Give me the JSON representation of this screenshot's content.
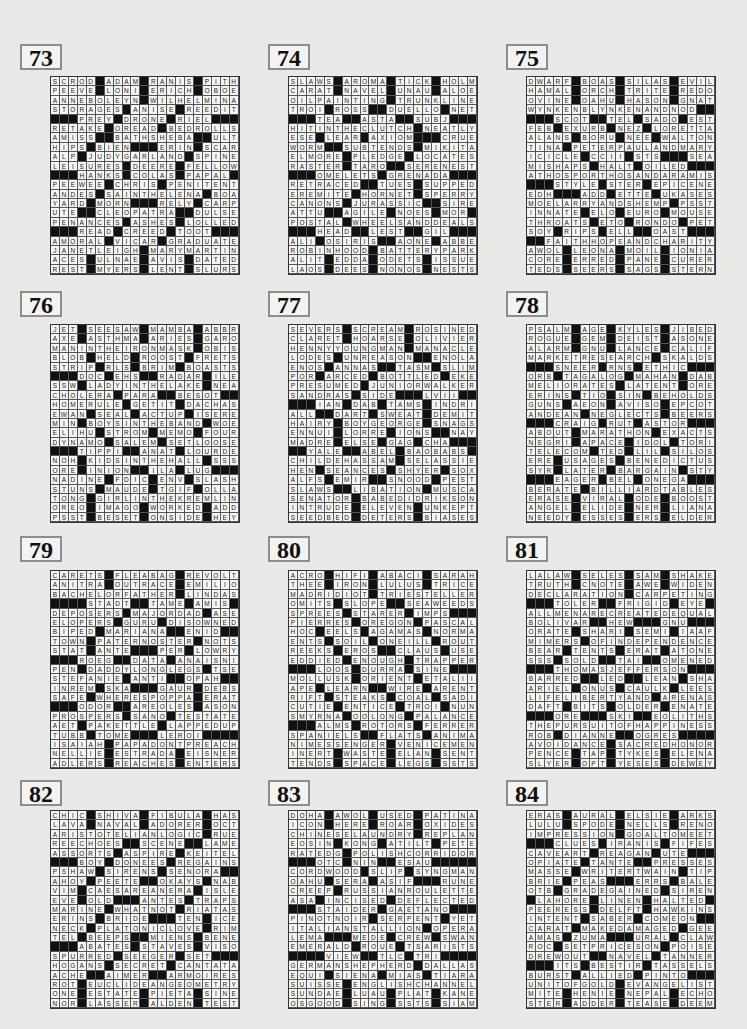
{
  "puzzles": [
    {
      "number": "73",
      "grid": [
        "SCROD#ADAM#RANIS#PITH",
        "PEEVE#LONI#ERICH#OBOE",
        "ANNEBOLEYN#WILHELMINA",
        "STORAGES#ANISE#REEDIT",
        "###PREY#DRONE#RIEL###",
        "RETAKE#OREAD#BEDROLLS",
        "AMISS##BATHSHEBA##ULT",
        "HIPS#BIEN###ERIN#SCAR",
        "ALP#JUDYGARLAND#SPINE",
        "LEISURES#DEERE#FELLOW",
        "###HANKS#COLAS#PAPAL#",
        "PEEWEE#CHRIS#PENITENT",
        "ANDES#SAINTHELENA#BOA",
        "YARD#MORN###RELY#CARP",
        "UTE##CLEOPATRA##DULSE",
        "PENANCES#ASHES#LOLLED",
        "###READ#CREED#TOOT###",
        "AMORAL#VICAR#GRADUATE",
        "JANETLEIGH#MARYMARTIN",
        "ACES#ULNAE#AVIS#DATED",
        "REST#MYERS#LENT#SLURS"
      ]
    },
    {
      "number": "74",
      "grid": [
        "SLAWS#AROMA#TICK#HOLM",
        "CARAT#NAVEL#UNAU#ALOE",
        "OILPAINTING#TRUNKLINE",
        "TROI#ROSS##DUELLO#NET",
        "###TEA##ASTA##SUBJ###",
        "HITINTHECLUTCH#NEATLY",
        "ESE#LEAR#AXIOM###CRUE",
        "WORM##SUBTENDS#MIKITA",
        "ELMORE#PLEDGE#LOCATES",
        "RASTER#TARO##SERENEST",
        "###OMELETS#GRENADA###",
        "RETRACED##TUES#SUPPED",
        "EREMITE#HORNET#SPERRY",
        "CANONS#JURASSIC##SIRE",
        "ATTU##AGILE#NOES#MOR",
        "POSTAL#WHEELSANDDEALS",
        "###HEAD##LEST##GIL###",
        "ALI#OSIRIS##AONE#ABBE",
        "ROBINHOOD#BATTERYPARK",
        "ALIT#EDDA#ODETS#ISSUE",
        "LAOS#DEES#NONOS#NESTS"
      ]
    },
    {
      "number": "75",
      "grid": [
        "DWARF#BOAS#SILAS#EVIL",
        "HAMAL#ORCH#TRITE#REDO",
        "OVINE#OAHU#HASON#GNAT",
        "WYNKENBLYNKENANDNOD##",
        "###SCOT##TEL#SADO#EST",
        "FEB#EXURB#NEZ#LORETTA",
        "ALANS#BORU#NEE#WALTON",
        "TINA#PETERPAULANDMARY",
        "ICICLE#CCII#STS###SEA",
        "MISHAPS#HALT#OILED###",
        "ATHOSPORTHOSANDARAMIS",
        "###STYLE#STER#EPICENE",
        "EDH###ADD#ETTE#UKASES",
        "MOELARRYANDSHEMP#PSST",
        "INNATE#ELO#EURO#MOUSE",
        "THROATS#ETO#RONDO#PET",
        "SOY#RIPS#ELL##OAST###",
        "##FAITHHOPEANDCHARITY",
        "AWOL#LEONA#MOIL#IONIA",
        "CORE#ERRED#PANE#CURER",
        "TEDS#SEERS#SAGS#STERN"
      ]
    },
    {
      "number": "76",
      "grid": [
        "JET#SEESAW#MAMBA#ABBR",
        "AXE#ASTHMA#ARIES#GARO",
        "MANINTHEIRONMASK#OBIS",
        "BLOB#HELD#ROOST#FRETS",
        "STRIP#RLS#BRIM#BOASTS",
        "###DOC#EHS##RADAR#ILE",
        "SSW#LADYINTHELAKE#NEA",
        "CHOLERA#PARA##BESOT##",
        "HOMERULE#GETIT#DACHAS",
        "EWAN#SEAL#ACTUP#ISERE",
        "MIN#BOYSINTHEBAND#WOE",
        "ELIHU#STROM#MEMO#FOUR",
        "DYNAMO#SALEM#SETLOOSE",
        "###TIPPI##ANAT#LOURDES",
        "NOH#KIDSINTHEHALL#SSS",
        "ORE#INION##ILA#LUG###",
        "NADINE#FDIC#ENV#SLASH",
        "STUNS#MAUDE#TGIF#OLLA",
        "TONG#GIRLINTHEKREMLIN",
        "OREO#IMAGO#WORKED#ADD",
        "PSST#BESET#ONSIDE#HEY"
      ]
    },
    {
      "number": "77",
      "grid": [
        "SEVERS#SCREAM#ROSINED",
        "CLARET#HOARSE#OLIVIER",
        "HENNYYOUNGMAN#MANACLE",
        "LODES#UNREASON##ENOLA",
        "ENOS#ANNAS##TASM#SLIM",
        "POR#ARCED#BOTTLED#EKE",
        "PRESUMED#JUNIORWALKER",
        "SANDRAS#SIDE###LVII##",
        "###IAN#DAB#TAMS#INDRI",
        "ALL##DART#SWEAT#DEMIT",
        "HAIRY#BOYGEORGE#SNAGS",
        "ENNUI#LORRE#IONS##NAY",
        "MADRE#ELSE#GAG#CHA###",
        "##YALE##ABEL#BAOBABS",
        "CHILDEHASSAM#SELASSIE",
        "HEN#SEANCES#SHYER#SOX",
        "ALFS#EMIR##SNOOD#PEST",
        "SLAWS##LIBATION#MUSCA",
        "SENATOR#BABEDIDRIKSON",
        "INTRUDE#ELEVEN#UNKEPT",
        "SEEDBED#DETERS#BIASES"
      ]
    },
    {
      "number": "78",
      "grid": [
        "PSALM#AGE#KYLES#JIBED",
        "ROGUE#GEM#DEIST#ASONE",
        "ALARM#GNU#LANCE#CALIF",
        "MARKETRESEARCH#SKALDS",
        "###SNEER#RNS#ETHIC###",
        "ORB#TAGALOG#MAHAN#DAB",
        "MELIORATES#LATENT#ORE",
        "ERINS#TIO#SIN#BEHOLDS",
        "GUNS#AEON#AVISO#EPCOT",
        "ANDEAN#NEGLECTS#BEERS",
        "###CRAIG#RUT#ASTOR###",
        "ABOUT#MARATHON#EXACTS",
        "NEGRI#APACE#IDOL#TORI",
        "TELECOM#TED#LIL#SILOS",
        "ERE#USAGES#BENEDICTUS",
        "SYR#LATER#BARGAIN#STY",
        "###EAGER#BEL#ONEGA###",
        "BERATE#BILLIARDTABLES",
        "ERASE#VIRAL#ODE#BOOST",
        "ANGEL#ELIDE#NER#LIANA",
        "NEEDY#ESSES#ERS#ELDER"
      ]
    },
    {
      "number": "79",
      "grid": [
        "CARETS#FLEABAG#REVOLT",
        "ANITRA#OUTRACE#EMILIO",
        "BACHELORFATHER#LINDAS",
        "####STADT##TAME#AMIS",
        "DEPOSERS#MAJORDAD#ASE",
        "ELOPERS#GURU#DISOWNED",
        "BIPED#MARIANA##ENID##",
        "TOWN#PATERNOSTER#NOTS",
        "STAT#ANTE###PER#LOWRY",
        "###ROEG##DATA#ANAISNIN",
        "PEN#DADDYLONGLEGS#TSE",
        "STEFANIE#ANTI##OPAH##",
        "INREM#SKA###GAUR#DEBS",
        "SAFE#WHERESPOPPA#ERAT",
        "###ODOR##AREOLES#ASONE",
        "PROSPERS#SANO#TESTATE",
        "AET#PAKETTLE#LAPPEDUP",
        "TUBB#TOME###LEROI####",
        "ISAIAH#PAPADONTPREACH",
        "NELLIE#ESTRADA#EISNER",
        "ADLERS#REACHES#ENTERS"
      ]
    },
    {
      "number": "80",
      "grid": [
        "ACRO#HIFI#ABACI#SARAH",
        "THEE#IRON#LULUS#TRICE",
        "MADRIDIOT#TRIESTELLER",
        "OMITS#SLOPE##SEAWEEDS",
        "SPREES#STARER#IMPS###",
        "PIERRES#OREGON#PASCAL",
        "HOC#EELS#AGAMAS#NORMA",
        "ENTS#SOIL#ONEILL#ROUT",
        "REEKS#EROS##CLAUS#USE",
        "EDDIED#ENOUGH#TRAPPER",
        "###LOOS#DURRA#SINE###",
        "MOLLUSK#ORIENT#ETALII",
        "APE#LEARN##WIRE#ARENT",
        "RIFT#STEAKS#COAL#SADI",
        "CUTIE#ENTICE#TROI#NUN",
        "SMYRNA#OOLONG#PALANCE",
        "###ALMS#ROTORS#FERRER",
        "SPANIELS##FLATS#ANIMA",
        "NIMESSENGER#VENICEMEN",
        "INERT#WASTE#ELAN#SENT",
        "TENDS#SPACE#LEGS#SSTS"
      ]
    },
    {
      "number": "81",
      "grid": [
        "LALAW#SELES#SAM#SHAKE",
        "TRUTH#CNOTE#AWE#WIDEN",
        "DECLARATION#CARPETING",
        "###TOLER##FRIGID#EYE",
        "ALLMENARECREATEDEQUAL",
        "BOLIVAR##HEW###GNU###",
        "ORATE#SHARI#SEMI#IAAF",
        "MIMERS#OFINDEPENDENCE",
        "BEAR#TENTS#ERAT#ATONE",
        "SSS#SOLD##TAI##OMENED",
        "###THOMASJEFFERSON###",
        "BARRED##LED##LEAN#SHA",
        "ARIEL#ONUS#CAULK#LEES",
        "LIFELIBERTYAND#ARENAS",
        "DAFT#BITS#OLDER#ENATE",
        "###ORE###SKI##EOLITHS",
        "THEPURSUITOFHAPPINESS",
        "ROB#DIANNE##OGRES####",
        "AVOIDANCE#SACREDHONOR",
        "PENCE#TAP#TYKES#ELENA",
        "SLYER#OPT#YESES#DEWEY"
      ]
    },
    {
      "number": "82",
      "grid": [
        "CHIC#SHIVA#FIBULA#HAS",
        "LAVA#NAVAL#ADORER#OCT",
        "ARISTOTELIANLOGIC#RUE",
        "REECHOES##SCENE##LAME",
        "ASSORTS#ASPIRE#KEITEL",
        "###BOY#DONEES#REGAINS",
        "PSHAW#SIRENS#SENORA##",
        "AHOY#PEETE##OKAYS#NAB",
        "VIM#CAESAREANERA#ISLE",
        "EVE#OLD###ANTES#TRAPS",
        "MARINE#WHATNOT#RIATAS",
        "ERINS#BRIDE###TEN#ICE",
        "NECK#PLATONICLOVE#RIM",
        "TEL#BEEPS##MIENS#BENE",
        "###ABATES#STAVES#VISOR",
        "SPURRED#SEEGER#SET###",
        "HOGANS#SECRET#CANTATA",
        "ACHE##AIMER##ARMOIRES",
        "ROT#EUCLIDEANGEOMETRY",
        "ONE#ESTATE#PIETA#SINE",
        "NOR#LASSER#ALDEN#TEST"
      ]
    },
    {
      "number": "83",
      "grid": [
        "DOHA#AWOL#USED#PATINA",
        "ICON#HERE#ROAR#OXIDES",
        "CHINESELAUNDRY#REPLAN",
        "EOSIN#KONG#ATILT#PETE",
        "RATEDG#POLISHCORRIDOR",
        "###OTC#NIN##ESAU#####",
        "CORDWOOD#SLIP#SYNGMAN",
        "OAHU#SERA#ASIF###RUNE",
        "CREEP#RUSSIANROULETTE",
        "ASA#INCISED#DEFLECTED",
        "###STAIDER#GAETANO###",
        "PINOTNOIR#SERPENT#YET",
        "ITALIANSTALLION#OPERA",
        "LEMA###MEDE#CREW#SWAN",
        "EMERALD#ROUE#TSARISTS",
        "####VIEW##TLC#TRI####",
        "GERMANSHEPHERD#DALLAS",
        "EQUI#SIENA#MIAS#TIARA",
        "SUISSE#ENGLISHCHANNEL",
        "SUNDAE#LUAU#PLAT#KANE",
        "OSGOOD#SING#SSTS#SIAM"
      ]
    },
    {
      "number": "84",
      "grid": [
        "ERAS#AURAL#ELSIE#ARKS",
        "LULU#SPODE#NELLS#RENO",
        "IMPRESSION#GOALTOMEET",
        "###CLUES#IRANIS#FIFES",
        "CAVEART#REAGAN#UTE###",
        "OPIATE#TANTE##PRESSES",
        "MASSE#WRITERTWAIN#TIP",
        "BRIE#PEAS###ERRS#BALE",
        "OTB#GRADEGAINED#SIREN",
        "#LAHORE#LINEN#HALTED",
        "PEERESS#DELFT#HAWKINS",
        "INTENT#SABER#COMEON##",
        "CARAT#MAKEDAMAGED#GEE",
        "AMAS#ZUMA###URAL#CLAW",
        "ROC#SETPRICESON#POISE",
        "DREWOUT##NAVEL#TANNER",
        "###ITS#BESTIR#TASSELS",
        "BURST#ALLIED#PINTO###",
        "UNITOFGOLD#EVANGELIST",
        "MITE#HENIE#NEPAL#ECHO",
        "STER#ADDER#TEASE#DEEM"
      ]
    }
  ]
}
